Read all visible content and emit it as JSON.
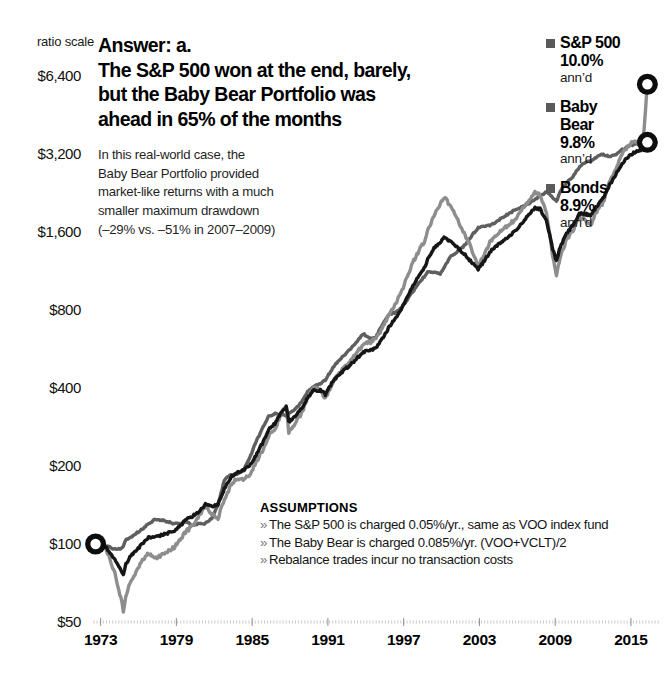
{
  "ratio_scale_label": "ratio scale",
  "headline": {
    "lines": [
      "Answer: a.",
      "The S&P 500 won at the end, barely,",
      "but the Baby Bear Portfolio was",
      "ahead in 65% of the months"
    ]
  },
  "subcopy": {
    "lines": [
      "In this real-world case, the",
      "Baby Bear Portfolio provided",
      "market-like returns with a much",
      "smaller maximum drawdown",
      "(–29% vs. –51% in 2007–2009)"
    ]
  },
  "legend": {
    "entries": [
      {
        "name": "S&P 500",
        "name2": "",
        "pct": "10.0%",
        "annd": "ann’d",
        "color": "#8d8d8d"
      },
      {
        "name": "Baby",
        "name2": "Bear",
        "pct": "9.8%",
        "annd": "ann’d",
        "color": "#121212"
      },
      {
        "name": "Bonds",
        "name2": "",
        "pct": "8.9%",
        "annd": "ann’d",
        "color": "#5e5e5e"
      }
    ]
  },
  "assumptions": {
    "title": "ASSUMPTIONS",
    "bullet": "»",
    "items": [
      "The S&P 500 is charged 0.05%/yr., same as VOO index fund",
      "The Baby Bear is charged 0.085%/yr. (VOO+VCLT)/2",
      "Rebalance trades incur no transaction costs"
    ]
  },
  "chart_data": {
    "type": "line",
    "title": "The S&P 500 won at the end, barely, but the Baby Bear Portfolio was ahead in 65% of the months",
    "xlabel": "",
    "ylabel": "",
    "scale": "log",
    "grid": true,
    "legend_position": "right",
    "yticks": [
      50,
      100,
      200,
      400,
      800,
      1600,
      3200,
      6400
    ],
    "ytick_labels": [
      "$50",
      "$100",
      "$200",
      "$400",
      "$800",
      "$1,600",
      "$3,200",
      "$6,400"
    ],
    "ylim": [
      50,
      6400
    ],
    "xticks": [
      1973,
      1979,
      1985,
      1991,
      1997,
      2003,
      2009,
      2015
    ],
    "xtick_labels": [
      "1973",
      "1979",
      "1985",
      "1991",
      "1997",
      "2003",
      "2009",
      "2015"
    ],
    "xlim": [
      1972.0,
      2017.3
    ],
    "start_marker": {
      "x": 1972.6,
      "y": 100,
      "label": "$100"
    },
    "end_markers": [
      {
        "series": "S&P 500",
        "x": 2016.3,
        "y": 5950
      },
      {
        "series": "Baby Bear",
        "x": 2016.3,
        "y": 3550
      }
    ],
    "series": [
      {
        "name": "S&P 500",
        "color": "#8d8d8d",
        "annualized_return": "10.0%",
        "max_drawdown": "-51%",
        "x": [
          1972.6,
          1973.0,
          1973.4,
          1973.8,
          1974.2,
          1974.6,
          1974.8,
          1975.0,
          1975.4,
          1975.8,
          1976.3,
          1976.8,
          1977.3,
          1977.8,
          1978.3,
          1978.8,
          1979.3,
          1979.8,
          1980.3,
          1980.8,
          1981.3,
          1981.8,
          1982.3,
          1982.8,
          1983.3,
          1983.8,
          1984.3,
          1984.8,
          1985.3,
          1985.8,
          1986.3,
          1986.8,
          1987.3,
          1987.7,
          1987.9,
          1988.4,
          1988.9,
          1989.4,
          1989.9,
          1990.4,
          1990.8,
          1991.3,
          1991.8,
          1992.3,
          1992.8,
          1993.3,
          1993.8,
          1994.3,
          1994.8,
          1995.3,
          1995.8,
          1996.3,
          1996.8,
          1997.3,
          1997.8,
          1998.3,
          1998.7,
          1998.9,
          1999.4,
          1999.9,
          2000.2,
          2000.7,
          2001.2,
          2001.7,
          2002.2,
          2002.7,
          2002.9,
          2003.4,
          2003.9,
          2004.4,
          2004.9,
          2005.4,
          2005.9,
          2006.4,
          2006.9,
          2007.4,
          2007.8,
          2008.3,
          2008.8,
          2009.1,
          2009.4,
          2009.9,
          2010.4,
          2010.9,
          2011.4,
          2011.8,
          2012.3,
          2012.8,
          2013.3,
          2013.8,
          2014.3,
          2014.8,
          2015.3,
          2015.8,
          2016.0,
          2016.3
        ],
        "y": [
          100,
          104,
          96,
          86,
          75,
          62,
          55,
          63,
          72,
          78,
          86,
          92,
          88,
          90,
          94,
          97,
          104,
          112,
          118,
          128,
          140,
          131,
          126,
          148,
          168,
          180,
          178,
          186,
          206,
          228,
          262,
          278,
          318,
          342,
          268,
          292,
          318,
          368,
          400,
          392,
          362,
          414,
          452,
          480,
          508,
          548,
          592,
          598,
          620,
          680,
          760,
          840,
          930,
          1080,
          1240,
          1380,
          1480,
          1620,
          1850,
          2060,
          2180,
          2020,
          1820,
          1620,
          1440,
          1260,
          1180,
          1320,
          1480,
          1560,
          1650,
          1720,
          1800,
          1960,
          2120,
          2280,
          2220,
          1900,
          1300,
          1080,
          1280,
          1500,
          1620,
          1820,
          1780,
          1700,
          1920,
          2080,
          2480,
          2820,
          3180,
          3480,
          3560,
          3620,
          3800,
          5950
        ]
      },
      {
        "name": "Baby Bear",
        "color": "#121212",
        "annualized_return": "9.8%",
        "max_drawdown": "-29%",
        "x": [
          1972.6,
          1973.0,
          1973.4,
          1973.8,
          1974.2,
          1974.6,
          1974.8,
          1975.0,
          1975.4,
          1975.8,
          1976.3,
          1976.8,
          1977.3,
          1977.8,
          1978.3,
          1978.8,
          1979.3,
          1979.8,
          1980.3,
          1980.8,
          1981.3,
          1981.8,
          1982.3,
          1982.8,
          1983.3,
          1983.8,
          1984.3,
          1984.8,
          1985.3,
          1985.8,
          1986.3,
          1986.8,
          1987.3,
          1987.7,
          1987.9,
          1988.4,
          1988.9,
          1989.4,
          1989.9,
          1990.4,
          1990.8,
          1991.3,
          1991.8,
          1992.3,
          1992.8,
          1993.3,
          1993.8,
          1994.3,
          1994.8,
          1995.3,
          1995.8,
          1996.3,
          1996.8,
          1997.3,
          1997.8,
          1998.3,
          1998.7,
          1998.9,
          1999.4,
          1999.9,
          2000.2,
          2000.7,
          2001.2,
          2001.7,
          2002.2,
          2002.7,
          2002.9,
          2003.4,
          2003.9,
          2004.4,
          2004.9,
          2005.4,
          2005.9,
          2006.4,
          2006.9,
          2007.4,
          2007.8,
          2008.3,
          2008.8,
          2009.1,
          2009.4,
          2009.9,
          2010.4,
          2010.9,
          2011.4,
          2011.8,
          2012.3,
          2012.8,
          2013.3,
          2013.8,
          2014.3,
          2014.8,
          2015.3,
          2015.8,
          2016.0,
          2016.3
        ],
        "y": [
          100,
          102,
          97,
          92,
          86,
          80,
          76,
          84,
          90,
          94,
          100,
          106,
          106,
          108,
          110,
          112,
          118,
          124,
          128,
          134,
          142,
          140,
          142,
          164,
          180,
          190,
          192,
          200,
          220,
          244,
          276,
          292,
          322,
          338,
          296,
          312,
          332,
          368,
          392,
          392,
          378,
          418,
          448,
          470,
          492,
          520,
          552,
          556,
          572,
          620,
          682,
          736,
          798,
          900,
          1010,
          1100,
          1170,
          1260,
          1380,
          1460,
          1520,
          1470,
          1400,
          1330,
          1250,
          1180,
          1150,
          1240,
          1350,
          1420,
          1490,
          1550,
          1620,
          1740,
          1860,
          1980,
          1960,
          1760,
          1380,
          1240,
          1400,
          1580,
          1700,
          1880,
          1880,
          1840,
          2020,
          2160,
          2420,
          2660,
          2940,
          3140,
          3240,
          3320,
          3440,
          3550
        ]
      },
      {
        "name": "Bonds",
        "color": "#5e5e5e",
        "annualized_return": "8.9%",
        "x": [
          1972.6,
          1973.0,
          1973.4,
          1973.8,
          1974.2,
          1974.6,
          1974.8,
          1975.0,
          1975.4,
          1975.8,
          1976.3,
          1976.8,
          1977.3,
          1977.8,
          1978.3,
          1978.8,
          1979.3,
          1979.8,
          1980.3,
          1980.8,
          1981.3,
          1981.8,
          1982.3,
          1982.8,
          1983.3,
          1983.8,
          1984.3,
          1984.8,
          1985.3,
          1985.8,
          1986.3,
          1986.8,
          1987.3,
          1987.7,
          1987.9,
          1988.4,
          1988.9,
          1989.4,
          1989.9,
          1990.4,
          1990.8,
          1991.3,
          1991.8,
          1992.3,
          1992.8,
          1993.3,
          1993.8,
          1994.3,
          1994.8,
          1995.3,
          1995.8,
          1996.3,
          1996.8,
          1997.3,
          1997.8,
          1998.3,
          1998.7,
          1998.9,
          1999.4,
          1999.9,
          2000.2,
          2000.7,
          2001.2,
          2001.7,
          2002.2,
          2002.7,
          2002.9,
          2003.4,
          2003.9,
          2004.4,
          2004.9,
          2005.4,
          2005.9,
          2006.4,
          2006.9,
          2007.4,
          2007.8,
          2008.3,
          2008.8,
          2009.1,
          2009.4,
          2009.9,
          2010.4,
          2010.9,
          2011.4,
          2011.8,
          2012.3,
          2012.8,
          2013.3,
          2013.8,
          2014.3,
          2014.8,
          2015.3,
          2015.8,
          2016.0,
          2016.3
        ],
        "y": [
          100,
          100,
          98,
          97,
          95,
          96,
          98,
          104,
          106,
          110,
          114,
          120,
          124,
          124,
          122,
          120,
          120,
          122,
          118,
          120,
          120,
          126,
          142,
          176,
          186,
          186,
          192,
          214,
          248,
          278,
          310,
          318,
          314,
          312,
          318,
          330,
          352,
          386,
          406,
          414,
          430,
          470,
          508,
          536,
          568,
          606,
          648,
          620,
          628,
          700,
          768,
          780,
          812,
          880,
          952,
          1030,
          1090,
          1130,
          1120,
          1100,
          1170,
          1280,
          1340,
          1400,
          1500,
          1620,
          1660,
          1680,
          1700,
          1760,
          1830,
          1890,
          1960,
          2000,
          2060,
          2140,
          2200,
          2280,
          2180,
          2100,
          2300,
          2480,
          2620,
          2840,
          2980,
          3000,
          3120,
          3200,
          3120,
          3180,
          3340,
          3420,
          3480,
          3540,
          3560,
          3580
        ]
      }
    ]
  }
}
